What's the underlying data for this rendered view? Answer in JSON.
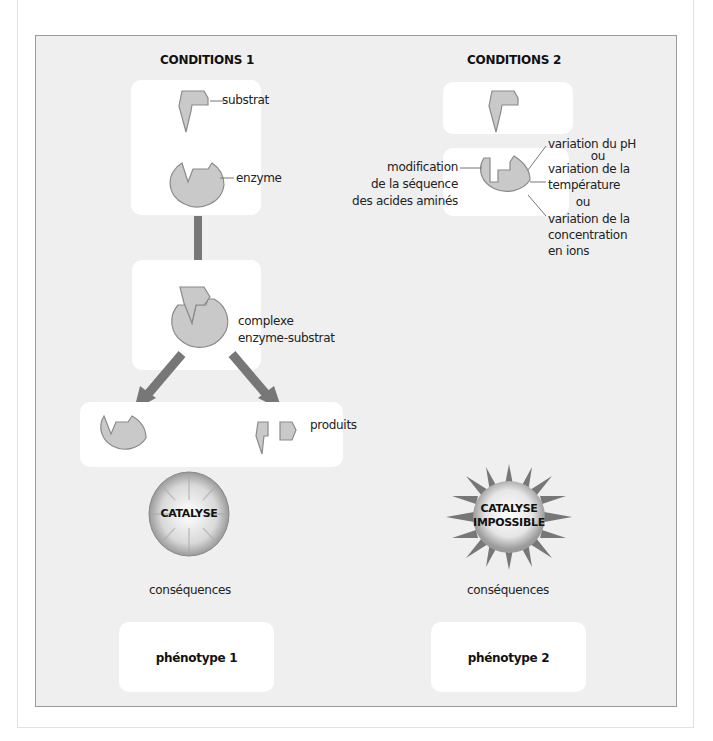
{
  "conditions_1": {
    "title": "CONDITIONS 1",
    "labels": {
      "substrat": "substrat",
      "enzyme": "enzyme",
      "complexe_line1": "complexe",
      "complexe_line2": "enzyme-substrat",
      "produits": "produits"
    },
    "result_badge": "CATALYSE",
    "consequences": "conséquences",
    "phenotype": "phénotype 1"
  },
  "conditions_2": {
    "title": "CONDITIONS 2",
    "labels": {
      "modification_line1": "modification",
      "modification_line2": "de la séquence",
      "modification_line3": "des acides aminés",
      "ph": "variation du pH",
      "ou_1": "ou",
      "temperature_line1": "variation de la",
      "temperature_line2": "température",
      "ou_2": "ou",
      "ions_line1": "variation de la",
      "ions_line2": "concentration",
      "ions_line3": "en ions"
    },
    "result_badge_line1": "CATALYSE",
    "result_badge_line2": "IMPOSSIBLE",
    "consequences": "conséquences",
    "phenotype": "phénotype 2"
  },
  "colors": {
    "panel_bg": "#efefef",
    "shape_fill": "#c8c8c8",
    "shape_stroke": "#8a8a8a",
    "arrow": "#777777"
  }
}
